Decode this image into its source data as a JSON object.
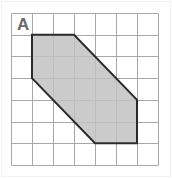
{
  "figure": {
    "label": "A",
    "label_name": "shape-label-a",
    "background_color": "#ffffff",
    "border_color": "#f2f2f2"
  },
  "grid": {
    "columns": 7,
    "rows": 7,
    "origin_x": 11,
    "origin_y": 13,
    "cell_width": 21,
    "cell_height": 21.7,
    "line_color": "#a8a8a8",
    "line_width": 1,
    "visible": true
  },
  "shape": {
    "type": "hexagon",
    "name": "shaded-hexagon",
    "fill_color": "#c2c2c2",
    "fill_opacity": 0.85,
    "stroke_color": "#2b2b2b",
    "stroke_width": 2,
    "vertices_grid": [
      {
        "x": 1,
        "y": 1
      },
      {
        "x": 3,
        "y": 1
      },
      {
        "x": 6,
        "y": 4
      },
      {
        "x": 6,
        "y": 6
      },
      {
        "x": 4,
        "y": 6
      },
      {
        "x": 1,
        "y": 3
      }
    ],
    "vertex_count": 6
  },
  "chart_data": {
    "type": "scatter",
    "title": "A",
    "xlabel": "",
    "ylabel": "",
    "xlim": [
      0,
      7
    ],
    "ylim": [
      0,
      7
    ],
    "grid": true,
    "legend": "none",
    "series": [
      {
        "name": "hexagon-outline",
        "x": [
          1,
          3,
          6,
          6,
          4,
          1,
          1
        ],
        "y": [
          1,
          1,
          4,
          6,
          6,
          3,
          1
        ]
      }
    ],
    "annotations": [
      {
        "text": "A",
        "x": 0.5,
        "y": 0.5
      }
    ]
  }
}
